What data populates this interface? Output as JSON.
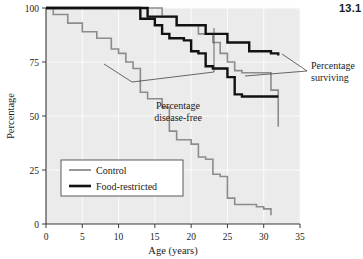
{
  "figure": {
    "number_label": "13.1"
  },
  "chart_data": {
    "type": "line",
    "title": "",
    "xlabel": "Age (years)",
    "ylabel": "Percentage",
    "xlim": [
      0,
      35
    ],
    "ylim": [
      0,
      100
    ],
    "xticks": [
      0,
      5,
      10,
      15,
      20,
      25,
      30,
      35
    ],
    "yticks": [
      0,
      25,
      50,
      75,
      100
    ],
    "grid": true,
    "grid_style": "light white gridlines on gray panel",
    "legend_position": "lower-left inside plot",
    "plot_background": "#ebebeb",
    "series": [
      {
        "name": "Control - Percentage surviving",
        "group": "Control",
        "measure": "surviving",
        "color": "#8c8c8c",
        "step": true,
        "x": [
          0,
          11,
          13,
          15,
          16,
          17,
          18,
          19,
          20,
          21,
          22,
          23,
          24,
          25,
          26,
          27,
          29,
          31,
          32
        ],
        "y": [
          100,
          100,
          100,
          100,
          96,
          96,
          92,
          92,
          92,
          88,
          88,
          84,
          79,
          75,
          71,
          70,
          70,
          62,
          45
        ]
      },
      {
        "name": "Food-restricted - Percentage surviving",
        "group": "Food-restricted",
        "measure": "surviving",
        "color": "#111111",
        "step": true,
        "x": [
          0,
          11,
          12,
          14,
          15,
          16,
          18,
          20,
          22,
          23,
          25,
          26,
          28,
          29,
          31,
          32
        ],
        "y": [
          100,
          100,
          100,
          96,
          96,
          96,
          92,
          92,
          88,
          88,
          84,
          84,
          80,
          80,
          79,
          78
        ]
      },
      {
        "name": "Control - Percentage disease-free",
        "group": "Control",
        "measure": "disease-free",
        "color": "#8c8c8c",
        "step": true,
        "x": [
          0,
          1,
          3,
          5,
          7,
          9,
          10,
          11,
          12,
          13,
          14,
          16,
          17,
          18,
          20,
          21,
          22,
          23,
          24,
          25,
          26,
          27,
          29,
          30,
          31
        ],
        "y": [
          100,
          97,
          93,
          89,
          86,
          81,
          79,
          75,
          72,
          61,
          58,
          54,
          43,
          39,
          37,
          31,
          30,
          23,
          22,
          12,
          9,
          9,
          8,
          7,
          4
        ]
      },
      {
        "name": "Food-restricted - Percentage disease-free",
        "group": "Food-restricted",
        "measure": "disease-free",
        "color": "#111111",
        "step": true,
        "x": [
          0,
          12,
          13,
          15,
          16,
          17,
          19,
          20,
          21,
          22,
          23,
          24,
          25,
          26,
          27,
          29,
          31,
          32
        ],
        "y": [
          100,
          100,
          95,
          92,
          88,
          86,
          85,
          80,
          79,
          73,
          72,
          72,
          68,
          60,
          59,
          59,
          59,
          59
        ]
      }
    ],
    "legend": [
      {
        "label": "Control",
        "color": "#8c8c8c",
        "line_width": 1.6
      },
      {
        "label": "Food-restricted",
        "color": "#111111",
        "line_width": 2.4
      }
    ],
    "annotations": [
      {
        "id": "disease-free",
        "lines": [
          "Percentage",
          "disease-free"
        ],
        "text": "Percentage disease-free",
        "leader_targets": [
          "Control disease-free curve",
          "Food-restricted disease-free curve"
        ]
      },
      {
        "id": "surviving",
        "lines": [
          "Percentage",
          "surviving"
        ],
        "text": "Percentage surviving",
        "leader_targets": [
          "Control surviving curve",
          "Food-restricted surviving curve"
        ]
      }
    ]
  }
}
